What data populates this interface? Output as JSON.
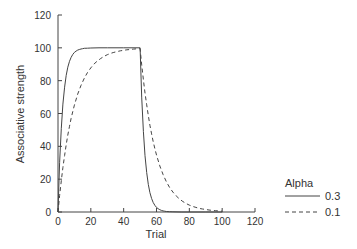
{
  "chart_data": {
    "type": "line",
    "title": "",
    "xlabel": "Trial",
    "ylabel": "Associative strength",
    "xlim": [
      0,
      120
    ],
    "ylim": [
      0,
      120
    ],
    "xticks": [
      0,
      20,
      40,
      60,
      80,
      100,
      120
    ],
    "yticks": [
      0,
      20,
      40,
      60,
      80,
      100,
      120
    ],
    "grid": false,
    "legend": {
      "title": "Alpha",
      "position": "right-bottom",
      "entries": [
        "0.3",
        "0.1"
      ]
    },
    "series": [
      {
        "name": "0.3",
        "style": "solid",
        "x": [
          0,
          1,
          2,
          3,
          4,
          5,
          6,
          7,
          8,
          9,
          10,
          11,
          12,
          13,
          14,
          15,
          16,
          18,
          20,
          25,
          30,
          40,
          50,
          51,
          52,
          53,
          54,
          55,
          56,
          57,
          58,
          59,
          60,
          61,
          62,
          63,
          64,
          65,
          66,
          68,
          70,
          75,
          80,
          90,
          100
        ],
        "values": [
          0,
          30,
          51,
          65.7,
          76,
          83.2,
          88.2,
          91.8,
          94.2,
          96,
          97.2,
          98,
          98.6,
          99,
          99.3,
          99.5,
          99.7,
          99.8,
          99.9,
          100,
          100,
          100,
          100,
          70,
          49,
          34.3,
          24,
          16.8,
          11.8,
          8.2,
          5.8,
          4,
          2.8,
          2,
          1.4,
          1,
          0.7,
          0.5,
          0.3,
          0.2,
          0.1,
          0,
          0,
          0,
          0
        ]
      },
      {
        "name": "0.1",
        "style": "dashed",
        "x": [
          0,
          1,
          2,
          3,
          4,
          5,
          6,
          7,
          8,
          9,
          10,
          12,
          14,
          16,
          18,
          20,
          22,
          24,
          26,
          28,
          30,
          32,
          34,
          36,
          38,
          40,
          42,
          44,
          46,
          48,
          50,
          51,
          52,
          53,
          54,
          55,
          56,
          57,
          58,
          59,
          60,
          62,
          64,
          66,
          68,
          70,
          72,
          74,
          76,
          78,
          80,
          82,
          84,
          86,
          88,
          90,
          92,
          94,
          96,
          98,
          100
        ],
        "values": [
          0,
          10,
          19,
          27.1,
          34.4,
          41,
          46.9,
          52.2,
          57,
          61.3,
          65.1,
          71.8,
          77.1,
          81.5,
          85,
          87.8,
          90.2,
          92,
          93.5,
          94.8,
          95.8,
          96.6,
          97.2,
          97.7,
          98.2,
          98.5,
          98.8,
          99,
          99.2,
          99.4,
          99.5,
          89.6,
          80.6,
          72.5,
          65.3,
          58.8,
          52.9,
          47.6,
          42.8,
          38.5,
          34.7,
          28.1,
          22.8,
          18.4,
          14.9,
          12.1,
          9.8,
          7.9,
          6.4,
          5.2,
          4.2,
          3.4,
          2.8,
          2.2,
          1.8,
          1.5,
          1.2,
          1,
          0.8,
          0.6,
          0.5
        ]
      }
    ]
  }
}
